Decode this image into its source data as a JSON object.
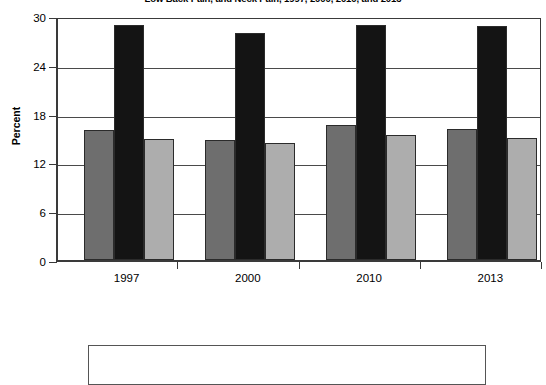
{
  "chart_data": {
    "type": "bar",
    "title": "Low Back Pain, and Neck Pain, 1997, 2000, 2010, and 2013",
    "xlabel": "",
    "ylabel": "Percent",
    "categories": [
      "1997",
      "2000",
      "2010",
      "2013"
    ],
    "ylim": [
      0,
      30
    ],
    "yticks": [
      0,
      6,
      12,
      18,
      24,
      30
    ],
    "ytick_labels": [
      "0",
      "6",
      "12",
      "18",
      "24",
      "30"
    ],
    "grid": true,
    "legend_position": "bottom",
    "series": [
      {
        "name": "series-1",
        "color": "#6e6e6e",
        "values": [
          16.0,
          14.8,
          16.6,
          16.1
        ]
      },
      {
        "name": "series-2",
        "color": "#141414",
        "values": [
          28.9,
          27.9,
          28.9,
          28.8
        ]
      },
      {
        "name": "series-3",
        "color": "#adadad",
        "values": [
          14.9,
          14.4,
          15.4,
          15.0
        ]
      }
    ],
    "annotations": []
  },
  "legend": {
    "visible": true,
    "entries": []
  },
  "colors": {
    "axis": "#3a3a3a",
    "grid": "#4a4a4a",
    "bar_edge": "#2b2b2b",
    "background": "#ffffff",
    "text": "#000000"
  }
}
